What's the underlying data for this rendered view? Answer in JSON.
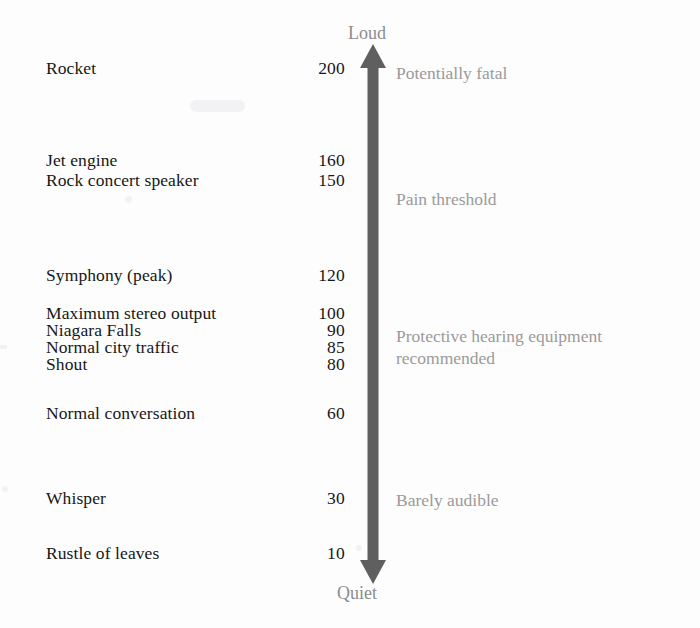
{
  "figure": {
    "background_color": "#fdfdfd",
    "label_color": "#171717",
    "annotation_color": "#9a9a9a",
    "arrow_color": "#5f5f5f"
  },
  "axis": {
    "top_cap": "Loud",
    "bottom_cap": "Quiet",
    "arrow_name": "double-headed-vertical-arrow"
  },
  "rows": [
    {
      "label": "Rocket",
      "value": "200",
      "top": 60
    },
    {
      "label": "Jet engine",
      "value": "160",
      "top": 152
    },
    {
      "label": "Rock concert speaker",
      "value": "150",
      "top": 172
    },
    {
      "label": "Symphony (peak)",
      "value": "120",
      "top": 267
    },
    {
      "label": "Maximum stereo output",
      "value": "100",
      "top": 305
    },
    {
      "label": "Niagara Falls",
      "value": "90",
      "top": 322
    },
    {
      "label": "Normal city traffic",
      "value": "85",
      "top": 339
    },
    {
      "label": "Shout",
      "value": "80",
      "top": 356
    },
    {
      "label": "Normal conversation",
      "value": "60",
      "top": 405
    },
    {
      "label": "Whisper",
      "value": "30",
      "top": 490
    },
    {
      "label": "Rustle of leaves",
      "value": "10",
      "top": 545
    }
  ],
  "annotations": [
    {
      "lines": [
        "Potentially fatal"
      ],
      "top": 62
    },
    {
      "lines": [
        "Pain threshold"
      ],
      "top": 188
    },
    {
      "lines": [
        "Protective hearing equipment",
        "recommended"
      ],
      "top": 325
    },
    {
      "lines": [
        "Barely audible"
      ],
      "top": 489
    }
  ],
  "chart_data": {
    "type": "bar",
    "xlabel": "",
    "ylabel": "Sound level (dB)",
    "ylim": [
      0,
      210
    ],
    "grid": false,
    "legend": "none",
    "orientation": "vertical-axis-annotated",
    "categories": [
      "Rocket",
      "Jet engine",
      "Rock concert speaker",
      "Symphony (peak)",
      "Maximum stereo output",
      "Niagara Falls",
      "Normal city traffic",
      "Shout",
      "Normal conversation",
      "Whisper",
      "Rustle of leaves"
    ],
    "values": [
      200,
      160,
      150,
      120,
      100,
      90,
      85,
      80,
      60,
      30,
      10
    ],
    "axis_endpoints": {
      "top": "Loud",
      "bottom": "Quiet"
    },
    "annotations": [
      {
        "text": "Potentially fatal",
        "approx_db": 200
      },
      {
        "text": "Pain threshold",
        "approx_db": 140
      },
      {
        "text": "Protective hearing equipment recommended",
        "approx_db": 90
      },
      {
        "text": "Barely audible",
        "approx_db": 30
      }
    ]
  }
}
